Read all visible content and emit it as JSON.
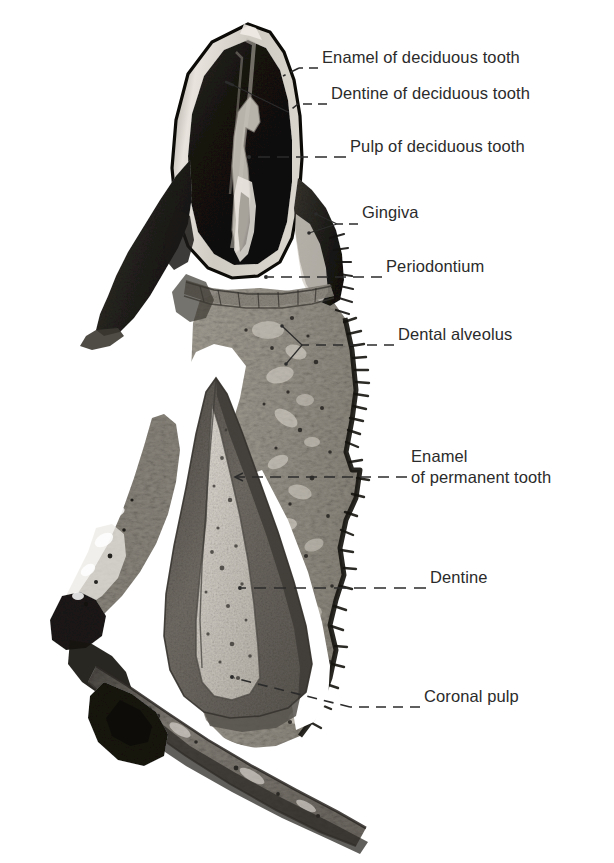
{
  "figure": {
    "kind": "histological-section-photomicrograph",
    "background_color": "#ffffff",
    "label_text_color": "#2b2b2b",
    "leader_line_color": "#2b2b2b",
    "width": 614,
    "height": 863
  },
  "labels": [
    {
      "id": "enamel-deciduous",
      "text": "Enamel of deciduous tooth",
      "text_x": 322,
      "text_y": 57,
      "leader": {
        "style": "dashed",
        "points": [
          [
            318,
            68
          ],
          [
            299,
            68
          ],
          [
            283,
            76
          ]
        ],
        "terminal": "point",
        "target_x": 283,
        "target_y": 76
      }
    },
    {
      "id": "dentine-deciduous",
      "text": "Dentine of deciduous tooth",
      "text_x": 331,
      "text_y": 93,
      "leader": {
        "style": "dashed",
        "points": [
          [
            327,
            104
          ],
          [
            296,
            104
          ],
          [
            287,
            113
          ],
          [
            232,
            84
          ]
        ],
        "terminal": "point",
        "target_x": 232,
        "target_y": 84
      }
    },
    {
      "id": "pulp-deciduous",
      "text": "Pulp of deciduous tooth",
      "text_x": 350,
      "text_y": 146,
      "leader": {
        "style": "dashed",
        "points": [
          [
            346,
            157
          ],
          [
            249,
            157
          ]
        ],
        "terminal": "point",
        "target_x": 249,
        "target_y": 157
      }
    },
    {
      "id": "gingiva",
      "text": "Gingiva",
      "text_x": 362,
      "text_y": 212,
      "leader": {
        "style": "dashed-forked",
        "points": [
          [
            358,
            224
          ],
          [
            336,
            224
          ]
        ],
        "fork": [
          [
            [
              336,
              224
            ],
            [
              318,
              215
            ]
          ],
          [
            [
              336,
              224
            ],
            [
              310,
              232
            ]
          ]
        ],
        "terminal": "fork",
        "target_x": 318,
        "target_y": 215
      }
    },
    {
      "id": "periodontium",
      "text": "Periodontium",
      "text_x": 386,
      "text_y": 266,
      "leader": {
        "style": "dashed",
        "points": [
          [
            382,
            277
          ],
          [
            266,
            277
          ]
        ],
        "terminal": "point",
        "target_x": 266,
        "target_y": 277
      }
    },
    {
      "id": "dental-alveolus",
      "text": "Dental alveolus",
      "text_x": 398,
      "text_y": 334,
      "leader": {
        "style": "dashed-forked",
        "points": [
          [
            394,
            345
          ],
          [
            300,
            345
          ]
        ],
        "fork": [
          [
            [
              300,
              345
            ],
            [
              281,
              325
            ]
          ],
          [
            [
              300,
              345
            ],
            [
              285,
              365
            ]
          ]
        ],
        "terminal": "fork",
        "target_x": 281,
        "target_y": 325
      }
    },
    {
      "id": "enamel-permanent",
      "text": "Enamel",
      "text_line2": "of permanent tooth",
      "text_x": 411,
      "text_y": 456,
      "leader": {
        "style": "dashed-arrow",
        "points": [
          [
            407,
            477
          ],
          [
            237,
            477
          ]
        ],
        "terminal": "arrow-left",
        "target_x": 237,
        "target_y": 477
      }
    },
    {
      "id": "dentine-permanent",
      "text": "Dentine",
      "text_x": 430,
      "text_y": 577,
      "leader": {
        "style": "dashed",
        "points": [
          [
            426,
            588
          ],
          [
            240,
            588
          ]
        ],
        "terminal": "point",
        "target_x": 240,
        "target_y": 588
      }
    },
    {
      "id": "coronal-pulp",
      "text": "Coronal pulp",
      "text_x": 424,
      "text_y": 696,
      "leader": {
        "style": "dashed",
        "points": [
          [
            420,
            707
          ],
          [
            348,
            707
          ],
          [
            232,
            677
          ]
        ],
        "terminal": "point",
        "target_x": 232,
        "target_y": 677
      }
    }
  ],
  "specimen_structures": [
    {
      "name": "deciduous-tooth-crown",
      "description": "Dark conical crown of the deciduous tooth at the top of the section",
      "tone": "#141414"
    },
    {
      "name": "deciduous-enamel-rim",
      "description": "Bright pale rim outlining the deciduous crown",
      "tone": "#e6e2dc"
    },
    {
      "name": "deciduous-pulp-cavity",
      "description": "Narrow pale pulp chamber running down the centre of the deciduous crown",
      "tone": "#c9c4bc"
    },
    {
      "name": "gingiva-tissue",
      "description": "Dark soft tissue collar flanking the deciduous crown on both sides",
      "tone": "#2a2724"
    },
    {
      "name": "alveolar-bone",
      "description": "Mid-grey mottled trabecular bone forming the dental alveolus on the right",
      "tone": "#9a958c"
    },
    {
      "name": "bone-serrated-border",
      "description": "Dark serrated periosteal border along the right margin of the bone",
      "tone": "#1f1d1b"
    },
    {
      "name": "follicle-space",
      "description": "White follicular space surrounding the permanent tooth germ",
      "tone": "#ffffff"
    },
    {
      "name": "permanent-tooth-dentine",
      "description": "Dark grey dentine shell of the developing permanent tooth",
      "tone": "#6e6a64"
    },
    {
      "name": "permanent-tooth-pulp",
      "description": "Pale speckled coronal pulp chamber inside the permanent tooth germ",
      "tone": "#cac5bd"
    },
    {
      "name": "permanent-tooth-enamel",
      "description": "Thin enamel layer capping the permanent tooth germ",
      "tone": "#4a4742"
    },
    {
      "name": "basal-bone-band",
      "description": "Diagonal band of bone sweeping across the lower part of the section",
      "tone": "#7d7871"
    },
    {
      "name": "left-bone-spur",
      "description": "Irregular dark bone spur projecting to the left below mid-height",
      "tone": "#33302c"
    }
  ]
}
